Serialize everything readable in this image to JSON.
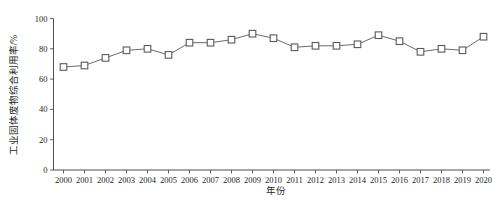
{
  "figure": {
    "background": "#ffffff"
  },
  "chart_data": {
    "type": "line",
    "title": "",
    "xlabel": "年份",
    "ylabel": "工业固体废物综合利用率/%",
    "categories": [
      2000,
      2001,
      2002,
      2003,
      2004,
      2005,
      2006,
      2007,
      2008,
      2009,
      2010,
      2011,
      2012,
      2013,
      2014,
      2015,
      2016,
      2017,
      2018,
      2019,
      2020
    ],
    "series": [
      {
        "name": "工业固体废物综合利用率",
        "values": [
          68,
          69,
          74,
          79,
          80,
          76,
          84,
          84,
          86,
          90,
          87,
          81,
          82,
          82,
          83,
          89,
          85,
          78,
          80,
          79,
          88
        ]
      }
    ],
    "ylim": [
      0,
      100
    ],
    "yticks": [
      0,
      20,
      40,
      60,
      80,
      100
    ],
    "grid": false,
    "legend_position": "none",
    "marker": "open-square",
    "colors": {
      "line": "#5a5a5a",
      "marker_fill": "#ffffff",
      "marker_stroke": "#5a5a5a",
      "axis": "#3c3c3c",
      "text": "#262626"
    }
  }
}
